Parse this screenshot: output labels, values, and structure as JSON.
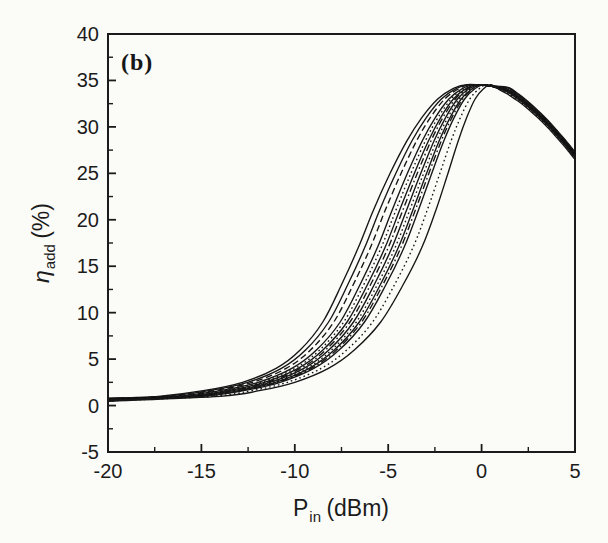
{
  "figure": {
    "panel_label": "(b)",
    "paper_color": "#fbfbf8",
    "ink_color": "#1b1b1b",
    "curve_color": "#141414"
  },
  "axes": {
    "x": {
      "label_base": "P",
      "label_sub": "in",
      "label_rest": " (dBm)",
      "min": -20,
      "max": 5,
      "major_ticks": [
        -20,
        -15,
        -10,
        -5,
        0,
        5
      ],
      "tick_labels": [
        "-20",
        "-15",
        "-10",
        "-5",
        "0",
        "5"
      ],
      "minor_ticks": [
        -17.5,
        -12.5,
        -7.5,
        -2.5,
        2.5
      ]
    },
    "y": {
      "label_base": "η",
      "label_sub": "add",
      "label_rest": " (%)",
      "min": -5,
      "max": 40,
      "major_ticks": [
        -5,
        0,
        5,
        10,
        15,
        20,
        25,
        30,
        35,
        40
      ],
      "tick_labels": [
        "-5",
        "0",
        "5",
        "10",
        "15",
        "20",
        "25",
        "30",
        "35",
        "40"
      ],
      "minor_ticks": [
        -2.5,
        2.5,
        7.5,
        12.5,
        17.5,
        22.5,
        27.5,
        32.5,
        37.5
      ]
    }
  },
  "chart_data": {
    "type": "line",
    "title": "",
    "annotation": "(b)",
    "xlabel": "P_in (dBm)",
    "ylabel": "η_add (%)",
    "xlim": [
      -20,
      5
    ],
    "ylim": [
      -5,
      40
    ],
    "grid": false,
    "legend": null,
    "n_curves": 14,
    "curve_family_description": "Family of 14 overlapping conversion-efficiency curves (mixed solid/dotted/dashed). All start near 0.5-0.8% at -20 dBm, fan out between -10 and -1 dBm, peak at about 34.5% near 0 dBm, then decrease together to about 26.5-27.5% at +5 dBm forming one thick band.",
    "shared_start": {
      "x": -20,
      "eta_base": 0.45,
      "eta_spread": 0.35
    },
    "rise_levels": [
      {
        "eta": 1.0,
        "x_left": -17.3,
        "x_right": -14.0
      },
      {
        "eta": 1.6,
        "x_left": -14.9,
        "x_right": -11.9
      },
      {
        "eta": 2.5,
        "x_left": -12.8,
        "x_right": -10.0
      },
      {
        "eta": 4.0,
        "x_left": -11.0,
        "x_right": -8.2
      },
      {
        "eta": 6.0,
        "x_left": -9.7,
        "x_right": -6.8
      },
      {
        "eta": 9.0,
        "x_left": -8.5,
        "x_right": -5.4
      },
      {
        "eta": 13.0,
        "x_left": -7.5,
        "x_right": -4.2
      },
      {
        "eta": 17.0,
        "x_left": -6.6,
        "x_right": -3.2
      },
      {
        "eta": 21.0,
        "x_left": -5.8,
        "x_right": -2.45
      },
      {
        "eta": 25.0,
        "x_left": -4.9,
        "x_right": -1.8
      },
      {
        "eta": 28.5,
        "x_left": -4.0,
        "x_right": -1.25
      },
      {
        "eta": 31.0,
        "x_left": -3.2,
        "x_right": -0.8
      },
      {
        "eta": 33.0,
        "x_left": -2.35,
        "x_right": -0.35
      },
      {
        "eta": 34.1,
        "x_left": -1.55,
        "x_right": 0.1
      },
      {
        "eta": 34.55,
        "x_left": -0.75,
        "x_right": 0.5
      }
    ],
    "shared_descent": [
      [
        1.0,
        34.15
      ],
      [
        1.5,
        33.8
      ],
      [
        2.0,
        33.1
      ],
      [
        2.5,
        32.3
      ],
      [
        3.0,
        31.4
      ],
      [
        3.5,
        30.4
      ],
      [
        4.0,
        29.3
      ],
      [
        4.5,
        28.15
      ],
      [
        5.0,
        26.9
      ]
    ],
    "descent_spread": 0.8,
    "curves": [
      {
        "t": 0.0,
        "style": "solid"
      },
      {
        "t": 0.1,
        "style": "solid"
      },
      {
        "t": 0.19,
        "style": "dash"
      },
      {
        "t": 0.3,
        "style": "solid"
      },
      {
        "t": 0.36,
        "style": "dot"
      },
      {
        "t": 0.42,
        "style": "solid"
      },
      {
        "t": 0.47,
        "style": "dashdot"
      },
      {
        "t": 0.53,
        "style": "solid"
      },
      {
        "t": 0.58,
        "style": "dot"
      },
      {
        "t": 0.63,
        "style": "solid"
      },
      {
        "t": 0.67,
        "style": "dashdot"
      },
      {
        "t": 0.72,
        "style": "solid"
      },
      {
        "t": 0.86,
        "style": "dot"
      },
      {
        "t": 1.0,
        "style": "solid"
      }
    ]
  }
}
